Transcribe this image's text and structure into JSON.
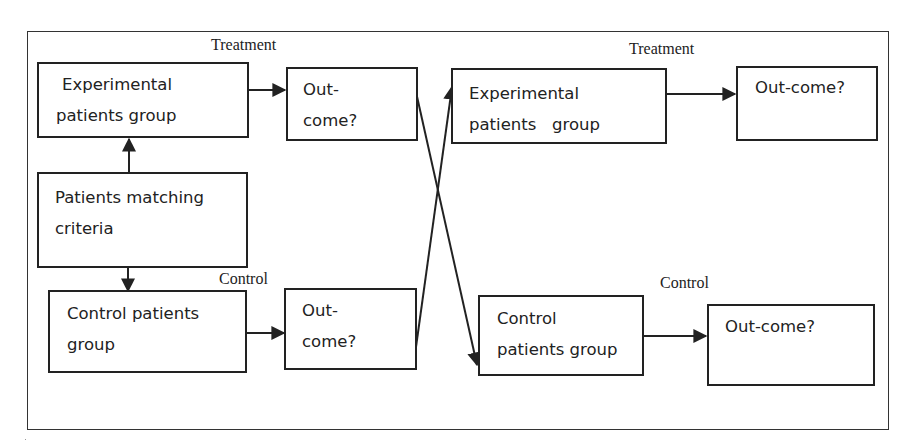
{
  "diagram": {
    "type": "crossover-trial-flowchart",
    "labels": {
      "treatment_left": "Treatment",
      "control_left": "Control",
      "treatment_right": "Treatment",
      "control_right": "Control"
    },
    "nodes": {
      "exp_group_1": {
        "lines": [
          "Experimental",
          "patients group"
        ]
      },
      "outcome_1": {
        "lines": [
          "Out-",
          "come?"
        ]
      },
      "patients_criteria": {
        "lines": [
          "Patients matching",
          "criteria"
        ]
      },
      "control_group_1": {
        "lines": [
          "Control patients",
          "group"
        ]
      },
      "outcome_2": {
        "lines": [
          "Out-",
          "come?"
        ]
      },
      "exp_group_2": {
        "lines": [
          "Experimental",
          "patients   group"
        ]
      },
      "outcome_3": {
        "lines": [
          "Out-come?"
        ]
      },
      "control_group_2": {
        "lines": [
          "Control",
          "patients group"
        ]
      },
      "outcome_4": {
        "lines": [
          "Out-come?"
        ]
      }
    },
    "edges": [
      {
        "from": "patients_criteria",
        "to": "exp_group_1"
      },
      {
        "from": "patients_criteria",
        "to": "control_group_1"
      },
      {
        "from": "exp_group_1",
        "to": "outcome_1"
      },
      {
        "from": "control_group_1",
        "to": "outcome_2"
      },
      {
        "from": "outcome_1",
        "to": "control_group_2"
      },
      {
        "from": "outcome_2",
        "to": "exp_group_2"
      },
      {
        "from": "exp_group_2",
        "to": "outcome_3"
      },
      {
        "from": "control_group_2",
        "to": "outcome_4"
      }
    ]
  }
}
